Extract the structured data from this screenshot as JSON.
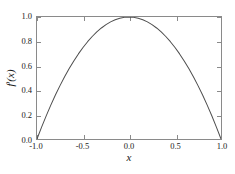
{
  "chart_data": {
    "type": "line",
    "title": "",
    "subtitle": "",
    "xlabel": "x",
    "ylabel": "f ′(x)",
    "ylabel_base": "f",
    "ylabel_prime": "′",
    "ylabel_arg": "(x)",
    "xlim": [
      -1.0,
      1.0
    ],
    "ylim": [
      0.0,
      1.0
    ],
    "grid": false,
    "legend": null,
    "legend_position": "none",
    "line_color": "#4d4d4d",
    "axis_color": "#8a8a8a",
    "background_color": "#ffffff",
    "xticks": [
      "-1.0",
      "-0.5",
      "0.0",
      "0.5",
      "1.0"
    ],
    "xtick_values": [
      -1.0,
      -0.5,
      0.0,
      0.5,
      1.0
    ],
    "yticks": [
      "0.0",
      "0.2",
      "0.4",
      "0.6",
      "0.8",
      "1.0"
    ],
    "ytick_values": [
      0.0,
      0.2,
      0.4,
      0.6,
      0.8,
      1.0
    ],
    "series": [
      {
        "name": "f'(x)",
        "x": [
          -1.0,
          -0.95,
          -0.9,
          -0.85,
          -0.8,
          -0.75,
          -0.7,
          -0.65,
          -0.6,
          -0.55,
          -0.5,
          -0.45,
          -0.4,
          -0.35,
          -0.3,
          -0.25,
          -0.2,
          -0.15,
          -0.1,
          -0.05,
          0.0,
          0.05,
          0.1,
          0.15,
          0.2,
          0.25,
          0.3,
          0.35,
          0.4,
          0.45,
          0.5,
          0.55,
          0.6,
          0.65,
          0.7,
          0.75,
          0.8,
          0.85,
          0.9,
          0.95,
          1.0
        ],
        "values": [
          0.0,
          0.0975,
          0.19,
          0.2775,
          0.36,
          0.4375,
          0.51,
          0.5775,
          0.64,
          0.6975,
          0.75,
          0.7975,
          0.84,
          0.8775,
          0.91,
          0.9375,
          0.96,
          0.9775,
          0.99,
          0.9975,
          1.0,
          0.9975,
          0.99,
          0.9775,
          0.96,
          0.9375,
          0.91,
          0.8775,
          0.84,
          0.7975,
          0.75,
          0.6975,
          0.64,
          0.5775,
          0.51,
          0.4375,
          0.36,
          0.2775,
          0.19,
          0.0975,
          0.0
        ]
      }
    ]
  }
}
